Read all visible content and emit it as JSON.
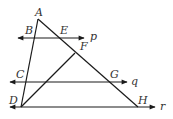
{
  "diagram": {
    "type": "geometry",
    "points": {
      "A": {
        "label": "A"
      },
      "B": {
        "label": "B"
      },
      "C": {
        "label": "C"
      },
      "D": {
        "label": "D"
      },
      "E": {
        "label": "E"
      },
      "F": {
        "label": "F"
      },
      "G": {
        "label": "G"
      },
      "H": {
        "label": "H"
      }
    },
    "lines": {
      "p": {
        "label": "p"
      },
      "q": {
        "label": "q"
      },
      "r": {
        "label": "r"
      }
    },
    "colors": {
      "stroke": "#1a1a1a",
      "label": "#333333",
      "background": "#ffffff"
    }
  }
}
